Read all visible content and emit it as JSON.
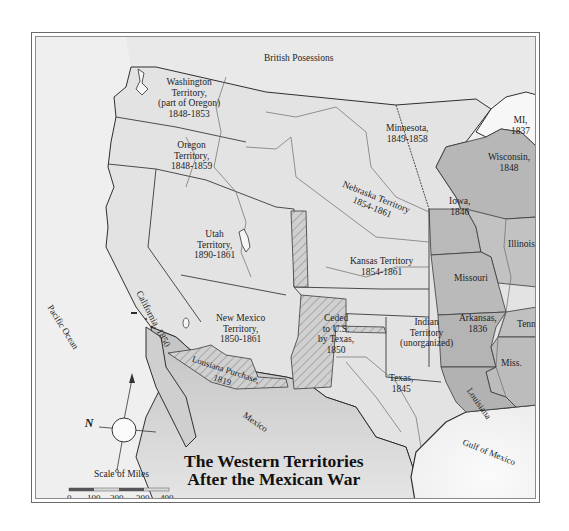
{
  "map": {
    "title_line1": "The Western Territories",
    "title_line2": "After the Mexican War",
    "colors": {
      "land_light": "#e8e8e8",
      "land_mid": "#d6d6d6",
      "states_dark": "#b4b4b4",
      "water": "#f7f7f7",
      "mexico": "#c8c8c8",
      "border": "#3a3a3a",
      "hatch": "#8a8a8a"
    },
    "regions": [
      {
        "id": "british-possessions",
        "label": "British Posessions"
      },
      {
        "id": "washington-territory",
        "label_lines": [
          "Washington",
          "Territory,",
          "(part of Oregon)",
          "1848-1853"
        ]
      },
      {
        "id": "oregon-territory",
        "label_lines": [
          "Oregon",
          "Territory,",
          "1848-1859"
        ]
      },
      {
        "id": "minnesota",
        "label_lines": [
          "Minnesota,",
          "1849-1858"
        ]
      },
      {
        "id": "michigan",
        "label_lines": [
          "MI,",
          "1837"
        ]
      },
      {
        "id": "wisconsin",
        "label_lines": [
          "Wisconsin,",
          "1848"
        ]
      },
      {
        "id": "nebraska-territory",
        "label_lines": [
          "Nebraska Territory",
          "1854-1861"
        ]
      },
      {
        "id": "iowa",
        "label_lines": [
          "Iowa,",
          "1846"
        ]
      },
      {
        "id": "illinois",
        "label_lines": [
          "Illinois"
        ]
      },
      {
        "id": "utah-territory",
        "label_lines": [
          "Utah",
          "Territory,",
          "1890-1861"
        ]
      },
      {
        "id": "kansas-territory",
        "label_lines": [
          "Kansas Territory",
          "1854-1861"
        ]
      },
      {
        "id": "missouri",
        "label_lines": [
          "Missouri"
        ]
      },
      {
        "id": "california",
        "label_lines": [
          "California, 1850"
        ]
      },
      {
        "id": "new-mexico-territory",
        "label_lines": [
          "New Mexico",
          "Territory,",
          "1850-1861"
        ]
      },
      {
        "id": "ceded-by-texas",
        "label_lines": [
          "Ceded",
          "to U.S.",
          "by Texas,",
          "1850"
        ]
      },
      {
        "id": "indian-territory",
        "label_lines": [
          "Indian",
          "Territory",
          "(unorganized)"
        ]
      },
      {
        "id": "arkansas",
        "label_lines": [
          "Arkansas,",
          "1836"
        ]
      },
      {
        "id": "tennessee",
        "label_lines": [
          "Tenn."
        ]
      },
      {
        "id": "mississippi",
        "label_lines": [
          "Miss."
        ]
      },
      {
        "id": "louisiana-purchase",
        "label_lines": [
          "Lousiana Purchase,",
          "1819"
        ]
      },
      {
        "id": "texas",
        "label_lines": [
          "Texas,",
          "1845"
        ]
      },
      {
        "id": "louisiana",
        "label_lines": [
          "Louisiana"
        ]
      },
      {
        "id": "mexico",
        "label_lines": [
          "Mexico"
        ]
      },
      {
        "id": "pacific-ocean",
        "label_lines": [
          "Pacific Ocean"
        ]
      },
      {
        "id": "gulf-of-mexico",
        "label_lines": [
          "Gulf of Mexico"
        ]
      }
    ],
    "compass": {
      "letter": "N"
    },
    "scale": {
      "title": "Scale of Miles",
      "ticks": [
        "0",
        "100",
        "200",
        "300",
        "400"
      ]
    }
  }
}
